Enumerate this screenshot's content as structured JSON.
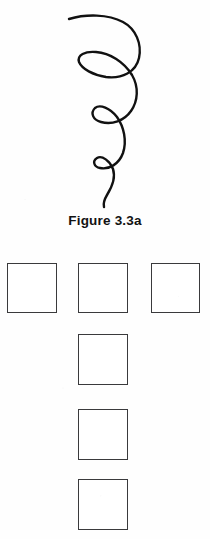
{
  "page": {
    "background_color": "#fefefe",
    "width": 210,
    "height": 539
  },
  "figure": {
    "name": "spiral-curve-drawing",
    "caption": "Figure 3.3a",
    "stroke_color": "#111111",
    "description_icon": "spiral-curve-icon",
    "loop_count": 3
  },
  "squares": {
    "border_color": "#3a3a3c",
    "fill_color": "#ffffff",
    "size": 50,
    "items": [
      {
        "name": "square-top-left",
        "x": 7,
        "y": 263,
        "w": 50,
        "h": 50
      },
      {
        "name": "square-top-middle",
        "x": 78,
        "y": 263,
        "w": 50,
        "h": 50
      },
      {
        "name": "square-top-right",
        "x": 151,
        "y": 263,
        "w": 49,
        "h": 50
      },
      {
        "name": "square-column-2",
        "x": 78,
        "y": 334,
        "w": 50,
        "h": 51
      },
      {
        "name": "square-column-3",
        "x": 78,
        "y": 409,
        "w": 50,
        "h": 51
      },
      {
        "name": "square-column-4",
        "x": 78,
        "y": 479,
        "w": 50,
        "h": 51
      }
    ]
  },
  "chart_data": {
    "type": "line",
    "title": "Figure 3.3a",
    "xlabel": "",
    "ylabel": "",
    "series": [
      {
        "name": "descending-spiral",
        "points": [
          [
            69,
            19
          ],
          [
            90,
            16
          ],
          [
            112,
            18
          ],
          [
            128,
            26
          ],
          [
            137,
            40
          ],
          [
            138,
            55
          ],
          [
            131,
            68
          ],
          [
            117,
            74
          ],
          [
            100,
            74
          ],
          [
            86,
            70
          ],
          [
            79,
            62
          ],
          [
            82,
            55
          ],
          [
            94,
            53
          ],
          [
            110,
            56
          ],
          [
            124,
            64
          ],
          [
            133,
            78
          ],
          [
            135,
            93
          ],
          [
            130,
            108
          ],
          [
            120,
            118
          ],
          [
            108,
            122
          ],
          [
            97,
            120
          ],
          [
            92,
            114
          ],
          [
            96,
            109
          ],
          [
            106,
            110
          ],
          [
            116,
            117
          ],
          [
            123,
            130
          ],
          [
            125,
            146
          ],
          [
            120,
            159
          ],
          [
            110,
            167
          ],
          [
            101,
            168
          ],
          [
            96,
            164
          ],
          [
            99,
            159
          ],
          [
            107,
            160
          ],
          [
            112,
            168
          ],
          [
            110,
            182
          ],
          [
            105,
            194
          ],
          [
            104,
            206
          ]
        ]
      }
    ],
    "grid": false,
    "legend": false
  }
}
